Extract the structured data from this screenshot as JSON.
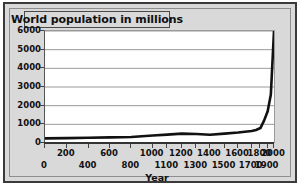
{
  "chart_data": {
    "type": "line",
    "title": "World population in millions",
    "xlabel": "Year",
    "ylabel": "",
    "xlim": [
      0,
      2000
    ],
    "ylim": [
      0,
      6000
    ],
    "grid": true,
    "legend": "none",
    "y_ticks": [
      0,
      1000,
      2000,
      3000,
      4000,
      5000,
      6000
    ],
    "y_tick_labels": [
      "0",
      "1000",
      "2000",
      "3000",
      "4000",
      "5000",
      "6000"
    ],
    "x_ticks": [
      0,
      200,
      400,
      600,
      800,
      1000,
      1100,
      1200,
      1300,
      1400,
      1500,
      1600,
      1700,
      1800,
      1900,
      2000
    ],
    "x_tick_labels_top": [
      "200",
      "600",
      "1000",
      "1200",
      "1400",
      "1600",
      "1800",
      "2000"
    ],
    "x_tick_labels_bottom": [
      "0",
      "400",
      "800",
      "1100",
      "1300",
      "1500",
      "1700",
      "1900"
    ],
    "x": [
      0,
      200,
      400,
      600,
      800,
      1000,
      1100,
      1200,
      1300,
      1400,
      1500,
      1600,
      1700,
      1750,
      1800,
      1850,
      1900,
      1950,
      2000
    ],
    "values": [
      250,
      260,
      280,
      300,
      320,
      400,
      450,
      500,
      480,
      440,
      500,
      560,
      640,
      700,
      800,
      1200,
      1700,
      2600,
      6000
    ],
    "series": [
      {
        "name": "World population",
        "values": [
          250,
          260,
          280,
          300,
          320,
          400,
          450,
          500,
          480,
          440,
          500,
          560,
          640,
          700,
          800,
          1200,
          1700,
          2600,
          6000
        ]
      }
    ],
    "line_color": "#111111",
    "plot_background": "#ffffff",
    "frame_background": "#d9d9d9"
  }
}
